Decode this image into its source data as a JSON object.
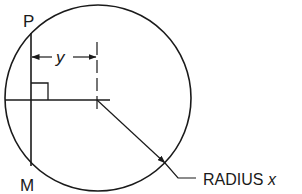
{
  "diagram": {
    "type": "geometry",
    "labels": {
      "point_top": "P",
      "point_bottom": "M",
      "distance": "y",
      "radius_label_prefix": "RADIUS ",
      "radius_variable": "x"
    },
    "colors": {
      "stroke": "#1a1a1a",
      "background": "#ffffff"
    }
  }
}
